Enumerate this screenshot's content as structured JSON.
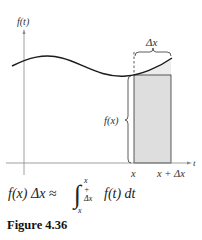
{
  "figure": {
    "y_axis_label": "f(t)",
    "x_axis_label": "t",
    "delta_label": "Δx",
    "height_label": "f(x)",
    "x_tick_left": "x",
    "x_tick_right": "x + Δx",
    "colors": {
      "curve": "#1a1a1a",
      "axis": "#777777",
      "rect_fill": "#dedede",
      "rect_stroke": "#333333"
    }
  },
  "formula": {
    "lhs": "f(x) Δx ≈",
    "upper_limit": "x + Δx",
    "lower_limit": "x",
    "integrand": "f(t) dt"
  },
  "caption": "Figure 4.36"
}
